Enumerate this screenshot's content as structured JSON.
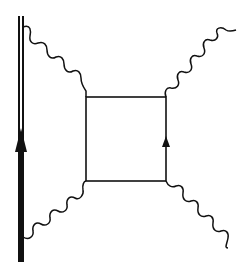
{
  "diagram": {
    "type": "feynman-diagram",
    "colors": {
      "ink": "#111111",
      "background": "#ffffff"
    },
    "heavy_line": {
      "x": 21,
      "y_top": 16,
      "y_bottom": 262,
      "arrow_direction": "up",
      "arrow_y": 130
    },
    "box": {
      "x1": 86,
      "y1": 97,
      "x2": 166,
      "y2": 181,
      "arrow_side": "right",
      "arrow_direction": "up",
      "arrow_y": 138
    },
    "photons": [
      {
        "name": "photon-top-left",
        "from": [
          23,
          27
        ],
        "to": [
          86,
          97
        ]
      },
      {
        "name": "photon-bottom-left",
        "from": [
          23,
          237
        ],
        "to": [
          86,
          181
        ]
      },
      {
        "name": "photon-top-right",
        "from": [
          166,
          97
        ],
        "to": [
          236,
          30
        ]
      },
      {
        "name": "photon-bottom-right",
        "from": [
          166,
          181
        ],
        "to": [
          228,
          248
        ]
      }
    ]
  }
}
